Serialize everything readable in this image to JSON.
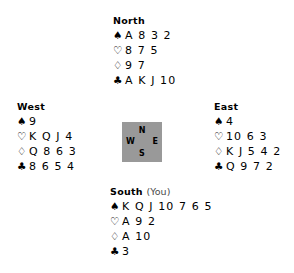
{
  "suit_symbols": {
    "spade": "♠",
    "heart": "♡",
    "diamond": "♢",
    "club": "♣"
  },
  "compass": {
    "north": "N",
    "west": "W",
    "east": "E",
    "south": "S",
    "background_color": "#999999"
  },
  "hands": {
    "north": {
      "label": "North",
      "annotation": "",
      "suits": [
        {
          "symbol": "♠",
          "name": "spades",
          "fill": "filled",
          "ranks": "A 8 3 2"
        },
        {
          "symbol": "♡",
          "name": "hearts",
          "fill": "outline",
          "ranks": "8 7 5"
        },
        {
          "symbol": "♢",
          "name": "diamonds",
          "fill": "outline",
          "ranks": "9 7"
        },
        {
          "symbol": "♣",
          "name": "clubs",
          "fill": "filled",
          "ranks": "A K J 10"
        }
      ]
    },
    "west": {
      "label": "West",
      "annotation": "",
      "suits": [
        {
          "symbol": "♠",
          "name": "spades",
          "fill": "filled",
          "ranks": "9"
        },
        {
          "symbol": "♡",
          "name": "hearts",
          "fill": "outline",
          "ranks": "K Q J 4"
        },
        {
          "symbol": "♢",
          "name": "diamonds",
          "fill": "outline",
          "ranks": "Q 8 6 3"
        },
        {
          "symbol": "♣",
          "name": "clubs",
          "fill": "filled",
          "ranks": "8 6 5 4"
        }
      ]
    },
    "east": {
      "label": "East",
      "annotation": "",
      "suits": [
        {
          "symbol": "♠",
          "name": "spades",
          "fill": "filled",
          "ranks": "4"
        },
        {
          "symbol": "♡",
          "name": "hearts",
          "fill": "outline",
          "ranks": "10 6 3"
        },
        {
          "symbol": "♢",
          "name": "diamonds",
          "fill": "outline",
          "ranks": "K J 5 4 2"
        },
        {
          "symbol": "♣",
          "name": "clubs",
          "fill": "filled",
          "ranks": "Q 9 7 2"
        }
      ]
    },
    "south": {
      "label": "South",
      "annotation": "(You)",
      "suits": [
        {
          "symbol": "♠",
          "name": "spades",
          "fill": "filled",
          "ranks": "K Q J 10 7 6 5"
        },
        {
          "symbol": "♡",
          "name": "hearts",
          "fill": "outline",
          "ranks": "A 9 2"
        },
        {
          "symbol": "♢",
          "name": "diamonds",
          "fill": "outline",
          "ranks": "A 10"
        },
        {
          "symbol": "♣",
          "name": "clubs",
          "fill": "filled",
          "ranks": "3"
        }
      ]
    }
  }
}
